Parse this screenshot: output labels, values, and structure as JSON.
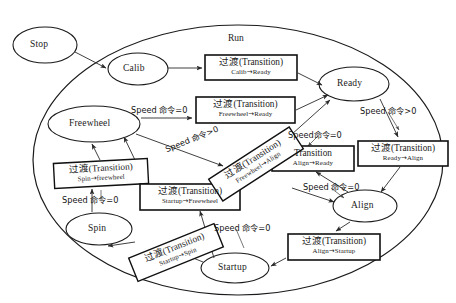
{
  "diagram": {
    "title_label": "Run",
    "type": "state-machine",
    "container_name": "Run",
    "states": [
      {
        "id": "stop",
        "label": "Stop",
        "cx": 45,
        "cy": 45,
        "rx": 32,
        "ry": 18,
        "inside_run": false
      },
      {
        "id": "calib",
        "label": "Calib",
        "cx": 138,
        "cy": 69,
        "rx": 30,
        "ry": 16,
        "inside_run": true
      },
      {
        "id": "ready",
        "label": "Ready",
        "cx": 354,
        "cy": 84,
        "rx": 35,
        "ry": 17,
        "inside_run": true
      },
      {
        "id": "freewheel",
        "label": "Freewheel",
        "cx": 94,
        "cy": 124,
        "rx": 46,
        "ry": 18,
        "inside_run": true
      },
      {
        "id": "align",
        "label": "Align",
        "cx": 365,
        "cy": 206,
        "rx": 32,
        "ry": 16,
        "inside_run": true
      },
      {
        "id": "spin",
        "label": "Spin",
        "cx": 99,
        "cy": 229,
        "rx": 33,
        "ry": 16,
        "inside_run": true
      },
      {
        "id": "startup",
        "label": "Startup",
        "cx": 235,
        "cy": 268,
        "rx": 34,
        "ry": 15,
        "inside_run": true
      }
    ],
    "transition_boxes": [
      {
        "id": "calib-ready",
        "head": "过渡(Transition)",
        "head_cn": "过渡",
        "head_en": "(Transition)",
        "sub_from": "Calib",
        "sub_to": "Ready",
        "x": 205,
        "y": 55,
        "w": 92,
        "h": 25,
        "rotation": 0
      },
      {
        "id": "freewheel-ready",
        "head": "过渡(Transition)",
        "head_cn": "过渡",
        "head_en": "(Transition)",
        "sub_from": "Freewheel",
        "sub_to": "Ready",
        "x": 196,
        "y": 97,
        "w": 99,
        "h": 26,
        "rotation": 0
      },
      {
        "id": "align-ready",
        "head": "Transition",
        "head_cn": "",
        "head_en": "Transition",
        "sub_from": "Align",
        "sub_to": "Ready",
        "x": 272,
        "y": 146,
        "w": 82,
        "h": 25,
        "rotation": 0
      },
      {
        "id": "ready-align",
        "head": "过渡(Transition)",
        "head_cn": "过渡",
        "head_en": "(Transition)",
        "sub_from": "Ready",
        "sub_to": "Align",
        "x": 358,
        "y": 141,
        "w": 90,
        "h": 25,
        "rotation": 0
      },
      {
        "id": "spin-freewheel",
        "head": "过渡(Transition)",
        "head_cn": "过渡",
        "head_en": "(Transition)",
        "sub_from": "Spin",
        "sub_to": "freewheel",
        "x": 54,
        "y": 161,
        "w": 94,
        "h": 25,
        "rotation": -3
      },
      {
        "id": "startup-freewheel",
        "head": "过渡(Transition)",
        "head_cn": "过渡",
        "head_en": "(Transition)",
        "sub_from": "Startup",
        "sub_to": "Freewheel",
        "x": 140,
        "y": 184,
        "w": 100,
        "h": 26,
        "rotation": 0
      },
      {
        "id": "freewheel-align",
        "head": "过渡(Transition)",
        "head_cn": "过渡",
        "head_en": "(Transition)",
        "sub_from": "Freewheel",
        "sub_to": "Align",
        "x": 208,
        "y": 151,
        "w": 96,
        "h": 26,
        "rotation": -33
      },
      {
        "id": "startup-spin",
        "head": "过渡(Transition)",
        "head_cn": "过渡",
        "head_en": "(Transition)",
        "sub_from": "Startup",
        "sub_to": "Spin",
        "x": 130,
        "y": 240,
        "w": 92,
        "h": 25,
        "rotation": -22
      },
      {
        "id": "align-startup",
        "head": "过渡(Transition)",
        "head_cn": "过渡",
        "head_en": "(Transition)",
        "sub_from": "Align",
        "sub_to": "Startup",
        "x": 288,
        "y": 234,
        "w": 92,
        "h": 26,
        "rotation": 0
      }
    ],
    "condition_labels": [
      {
        "id": "cond-freewheel-ready",
        "text": "Speed 命令=0",
        "x": 131,
        "y": 103,
        "rotation": 0
      },
      {
        "id": "cond-freewheel-align",
        "text": "Speed 命令>0",
        "x": 163,
        "y": 143,
        "rotation": -22
      },
      {
        "id": "cond-ready-align",
        "text": "Speed 命令>0",
        "x": 360,
        "y": 104,
        "rotation": 0
      },
      {
        "id": "cond-align-ready",
        "text": "Speed命令=0",
        "x": 288,
        "y": 128,
        "rotation": 0
      },
      {
        "id": "cond-align-startup",
        "text": "Speed 命令=0",
        "x": 303,
        "y": 180,
        "rotation": 0
      },
      {
        "id": "cond-spin-freewheel",
        "text": "Speed 命令=0",
        "x": 62,
        "y": 193,
        "rotation": 0
      },
      {
        "id": "cond-startup-spin",
        "text": "Speed 命令=0",
        "x": 214,
        "y": 221,
        "rotation": 0
      }
    ],
    "colors": {
      "background": "#ffffff",
      "stroke": "#1b1b1b",
      "box_stroke": "#111111",
      "connector": "#2a2a2a",
      "text": "#1a1a1a"
    },
    "arrow_symbol": "→"
  }
}
